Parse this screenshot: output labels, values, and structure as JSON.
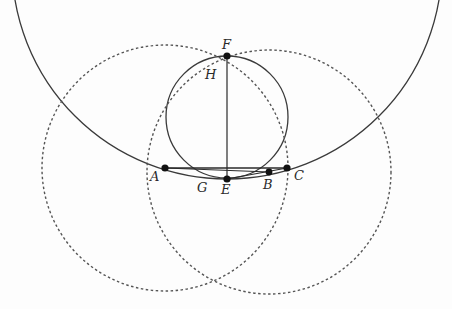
{
  "figure": {
    "width": 452,
    "height": 309,
    "colors": {
      "stroke": "#3a3a3a",
      "dashed": "#555555",
      "point": "#111111",
      "background": "#fdfdfd"
    }
  },
  "points": {
    "A": {
      "label": "A",
      "x": 165,
      "y": 168,
      "lx": 150,
      "ly": 181
    },
    "B": {
      "label": "B",
      "x": 269,
      "y": 172,
      "lx": 263,
      "ly": 189
    },
    "C": {
      "label": "C",
      "x": 287,
      "y": 168,
      "lx": 294,
      "ly": 180
    },
    "E": {
      "label": "E",
      "x": 227,
      "y": 179,
      "lx": 221,
      "ly": 194
    },
    "F": {
      "label": "F",
      "x": 227,
      "y": 56,
      "lx": 222,
      "ly": 49
    },
    "G": {
      "label": "G",
      "x": 203,
      "y": 181,
      "lx": 197,
      "ly": 192
    },
    "H": {
      "label": "H",
      "x": 213,
      "y": 68,
      "lx": 205,
      "ly": 79
    }
  },
  "circles": {
    "big_arc": {
      "cx": 227,
      "cy": -36,
      "r": 215,
      "style": "solid"
    },
    "small": {
      "cx": 227,
      "cy": 117,
      "r": 61,
      "style": "solid"
    },
    "dashed_left": {
      "cx": 165,
      "cy": 168,
      "r": 123,
      "style": "dashed"
    },
    "dashed_right": {
      "cx": 269,
      "cy": 172,
      "r": 122,
      "style": "dashed"
    }
  },
  "segments": [
    {
      "name": "segment-AC",
      "from": "A",
      "to": "C"
    },
    {
      "name": "segment-EF",
      "from": "E",
      "to": "F"
    },
    {
      "name": "segment-AB",
      "from": "A",
      "to": "B"
    }
  ]
}
